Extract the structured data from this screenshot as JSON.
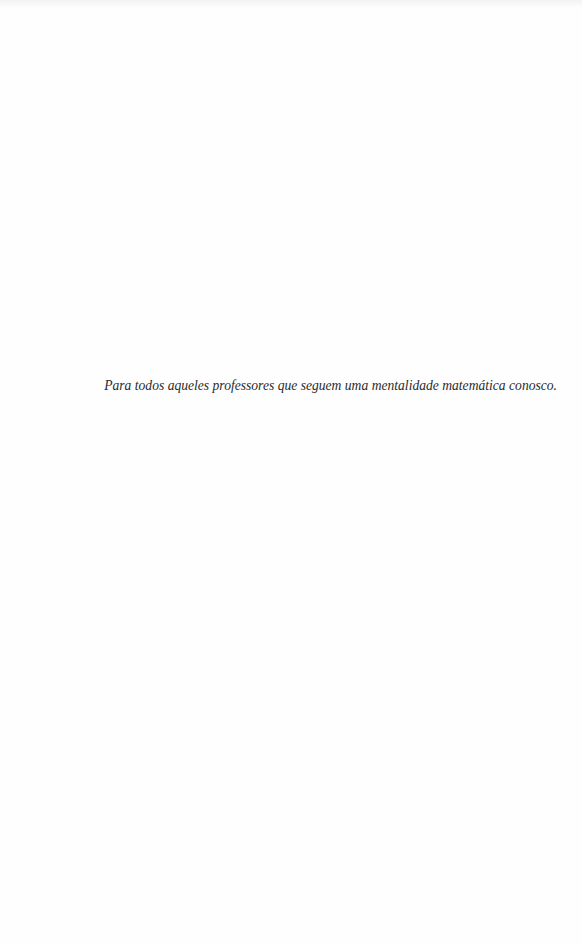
{
  "page": {
    "type": "dedication",
    "dedication_text": "Para todos aqueles professores que seguem uma mentalidade matemática conosco."
  }
}
